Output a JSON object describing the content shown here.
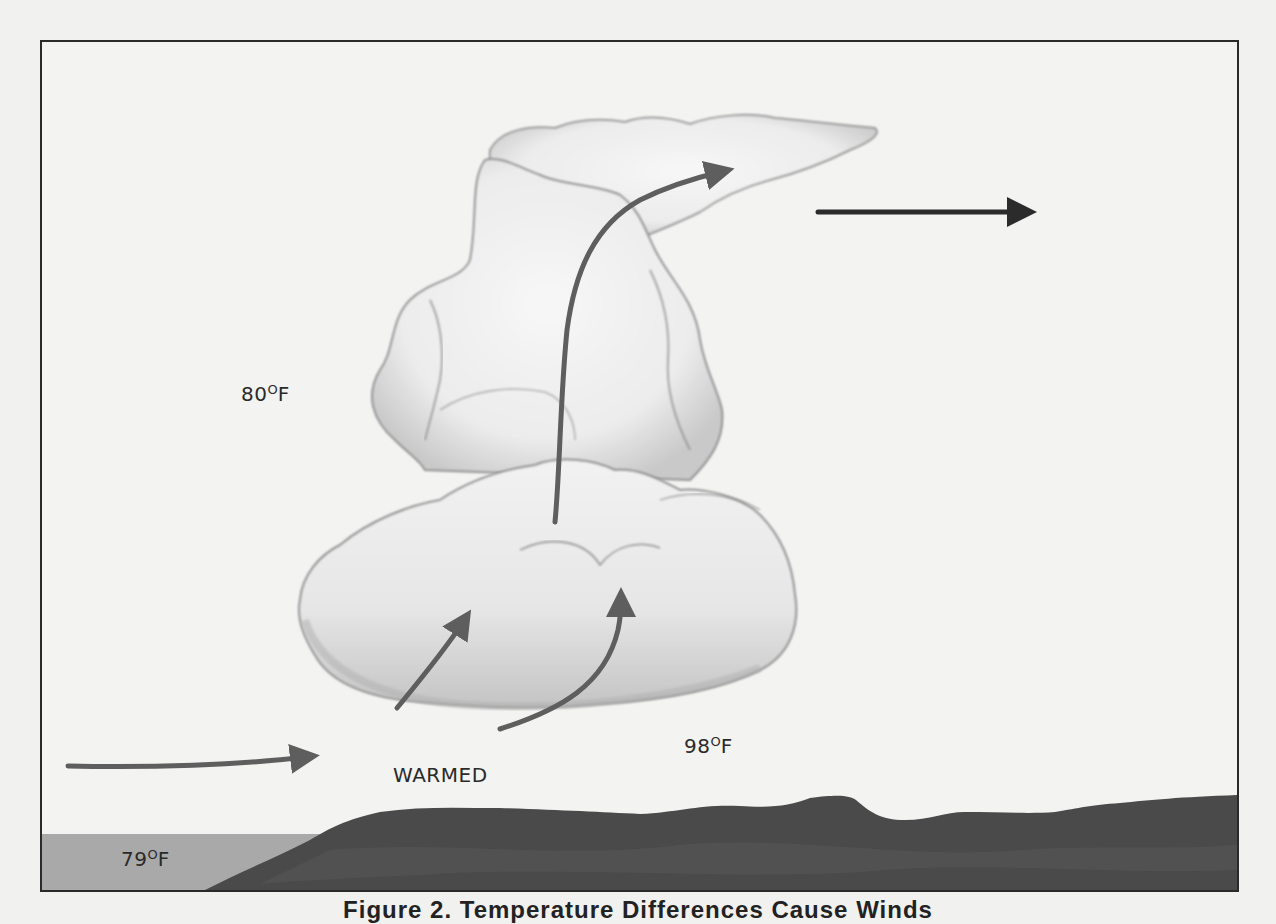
{
  "figure": {
    "caption": "Figure 2. Temperature Differences Cause Winds",
    "caption_visible": "partially cropped at bottom edge"
  },
  "labels": {
    "upper_air_temp": "80",
    "sea_temp": "79",
    "land_air_temp": "98",
    "degree_unit": "F",
    "warmed": "WARMED"
  },
  "arrows": [
    {
      "id": "sea-breeze-inflow",
      "description": "horizontal inflow from sea toward land",
      "color": "#5e5e5e"
    },
    {
      "id": "updraft-left",
      "description": "rising warmed air into cloud base (left)",
      "color": "#5e5e5e"
    },
    {
      "id": "updraft-right",
      "description": "rising warmed air into cloud base (right)",
      "color": "#5e5e5e"
    },
    {
      "id": "main-updraft",
      "description": "main updraft rising through cloud tower into anvil",
      "color": "#5e5e5e"
    },
    {
      "id": "upper-outflow",
      "description": "high-level outflow to the right",
      "color": "#2b2b2b"
    }
  ],
  "colors": {
    "background": "#f1f1f0",
    "frame": "#2a2a2a",
    "water": "#a9a9a9",
    "land": "#4a4a4a",
    "cloud_fill": "#f3f3f3",
    "cloud_shade": "#bdbdbd"
  }
}
